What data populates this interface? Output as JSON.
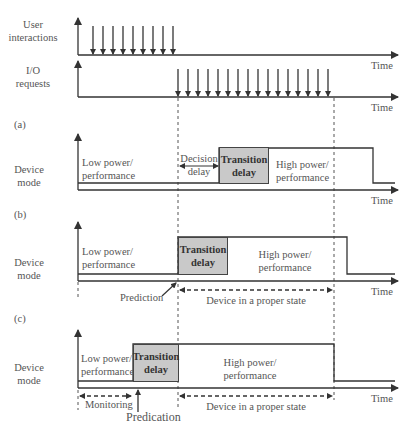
{
  "top": {
    "user_label": "User\ninteractions",
    "user_arrow_count": 9,
    "io_label": "I/O\nrequests",
    "io_arrow_count": 16,
    "time_label": "Time"
  },
  "panels": [
    {
      "id": "a",
      "tag": "(a)",
      "y_label": "Device\nmode",
      "low_label": "Low power/\nperformance",
      "decision_label": "Decision\ndelay",
      "transition_label": "Transition\ndelay",
      "high_label": "High power/\nperformance",
      "time_label": "Time"
    },
    {
      "id": "b",
      "tag": "(b)",
      "y_label": "Device\nmode",
      "low_label": "Low power/\nperformance",
      "transition_label": "Transition\ndelay",
      "high_label": "High power/\nperformance",
      "prediction_label": "Prediction",
      "proper_state_label": "Device in a proper state",
      "time_label": "Time"
    },
    {
      "id": "c",
      "tag": "(c)",
      "y_label": "Device\nmode",
      "low_label": "Low power/\nperformance",
      "transition_label": "Transition\ndelay",
      "high_label": "High power/\nperformance",
      "monitoring_label": "Monitoring",
      "predication_label": "Predication",
      "proper_state_label": "Device in a proper state",
      "time_label": "Time"
    }
  ]
}
